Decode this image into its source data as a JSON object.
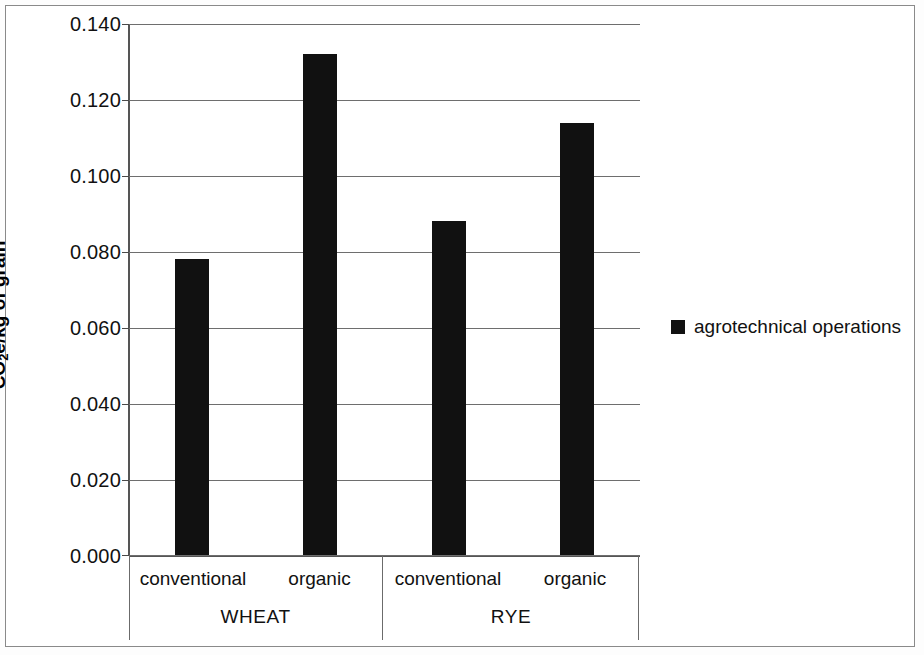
{
  "chart_data": {
    "type": "bar",
    "title": "",
    "xlabel": "",
    "ylabel": "CO2e/kg of grain",
    "ylabel_parts": {
      "pre": "CO",
      "sub": "2",
      "post": "e/kg of grain"
    },
    "ylim": [
      0.0,
      0.14
    ],
    "ytick_step": 0.02,
    "ytick_labels": [
      "0.140",
      "0.120",
      "0.100",
      "0.080",
      "0.060",
      "0.040",
      "0.020",
      "0.000"
    ],
    "ytick_values": [
      0.14,
      0.12,
      0.1,
      0.08,
      0.06,
      0.04,
      0.02,
      0.0
    ],
    "grid": true,
    "legend_position": "right",
    "bar_color": "#111111",
    "groups": [
      {
        "name": "WHEAT",
        "categories": [
          "conventional",
          "organic"
        ]
      },
      {
        "name": "RYE",
        "categories": [
          "conventional",
          "organic"
        ]
      }
    ],
    "categories": [
      "conventional",
      "organic",
      "conventional",
      "organic"
    ],
    "series": [
      {
        "name": "agrotechnical operations",
        "values": [
          0.078,
          0.132,
          0.088,
          0.114
        ]
      }
    ],
    "bars": [
      {
        "group": "WHEAT",
        "category": "conventional",
        "value": 0.078
      },
      {
        "group": "WHEAT",
        "category": "organic",
        "value": 0.132
      },
      {
        "group": "RYE",
        "category": "conventional",
        "value": 0.088
      },
      {
        "group": "RYE",
        "category": "organic",
        "value": 0.114
      }
    ]
  },
  "legend": {
    "entries": [
      {
        "label": "agrotechnical operations",
        "color": "#111111"
      }
    ]
  },
  "axis": {
    "y_title": "CO2e/kg of grain",
    "tick_0": "0.140",
    "tick_1": "0.120",
    "tick_2": "0.100",
    "tick_3": "0.080",
    "tick_4": "0.060",
    "tick_5": "0.040",
    "tick_6": "0.020",
    "tick_7": "0.000"
  },
  "category_labels": {
    "wheat_conventional": "conventional",
    "wheat_organic": "organic",
    "rye_conventional": "conventional",
    "rye_organic": "organic",
    "wheat": "WHEAT",
    "rye": "RYE"
  }
}
